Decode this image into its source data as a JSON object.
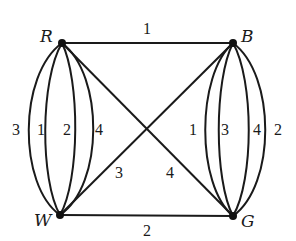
{
  "graph": {
    "nodes": [
      {
        "id": "R",
        "label": "R",
        "x": 62,
        "y": 43
      },
      {
        "id": "B",
        "label": "B",
        "x": 233,
        "y": 43
      },
      {
        "id": "W",
        "label": "W",
        "x": 60,
        "y": 215
      },
      {
        "id": "G",
        "label": "G",
        "x": 233,
        "y": 216
      }
    ],
    "edges": [
      {
        "from": "R",
        "to": "B",
        "label": "1"
      },
      {
        "from": "W",
        "to": "G",
        "label": "2"
      },
      {
        "from": "W",
        "to": "B",
        "label": "3"
      },
      {
        "from": "R",
        "to": "G",
        "label": "4"
      },
      {
        "from": "R",
        "to": "W",
        "label": "3"
      },
      {
        "from": "R",
        "to": "W",
        "label": "1"
      },
      {
        "from": "R",
        "to": "W",
        "label": "2"
      },
      {
        "from": "R",
        "to": "W",
        "label": "4"
      },
      {
        "from": "B",
        "to": "G",
        "label": "1"
      },
      {
        "from": "B",
        "to": "G",
        "label": "3"
      },
      {
        "from": "B",
        "to": "G",
        "label": "4"
      },
      {
        "from": "B",
        "to": "G",
        "label": "2"
      }
    ]
  }
}
